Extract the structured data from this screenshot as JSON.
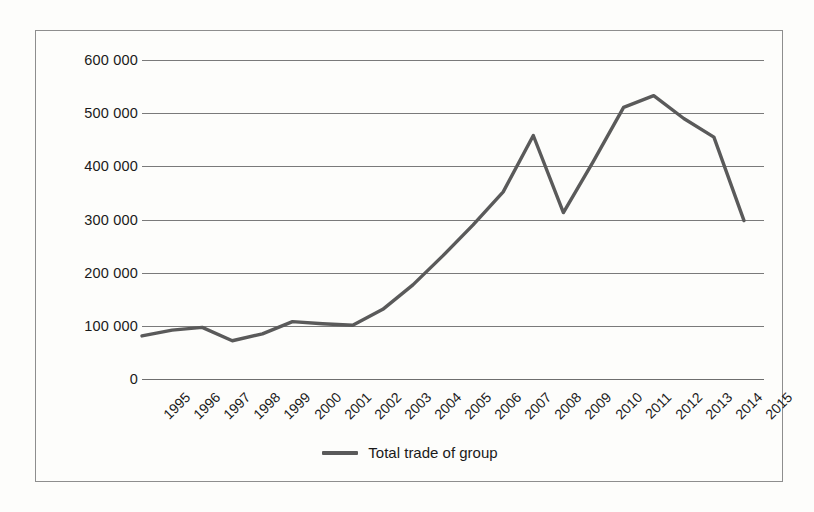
{
  "chart_data": {
    "type": "line",
    "title": "",
    "xlabel": "",
    "ylabel": "",
    "grid": true,
    "legend_position": "bottom-center",
    "categories": [
      "1995",
      "1996",
      "1997",
      "1998",
      "1999",
      "2000",
      "2001",
      "2002",
      "2003",
      "2004",
      "2005",
      "2006",
      "2007",
      "2008",
      "2009",
      "2010",
      "2011",
      "2012",
      "2013",
      "2014",
      "2015"
    ],
    "ylim": [
      0,
      600000
    ],
    "ytick_values": [
      0,
      100000,
      200000,
      300000,
      400000,
      500000,
      600000
    ],
    "ytick_labels": [
      "0",
      "100 000",
      "200 000",
      "300 000",
      "400 000",
      "500 000",
      "600 000"
    ],
    "series": [
      {
        "name": "Total trade of group",
        "color": "#5a5a5a",
        "values": [
          81000,
          92000,
          97000,
          72000,
          85000,
          108000,
          104000,
          101000,
          131000,
          177000,
          232000,
          290000,
          352000,
          458000,
          313000,
          410000,
          511000,
          533000,
          490000,
          455000,
          298000
        ]
      }
    ]
  },
  "legend": {
    "items": [
      {
        "label": "Total trade of group",
        "color": "#5a5a5a"
      }
    ]
  },
  "colors": {
    "series_line": "#5a5a5a",
    "grid_line": "#7a7a7a",
    "frame_border": "#8e8e8e",
    "background": "#fdfdfb",
    "text": "#1a1a1a"
  }
}
